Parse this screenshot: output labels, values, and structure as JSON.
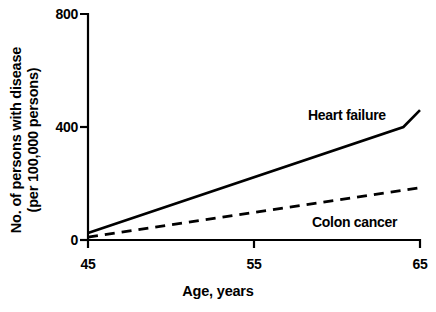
{
  "chart_data": {
    "type": "line",
    "title": "",
    "xlabel": "Age, years",
    "ylabel_line1": "No. of persons with disease",
    "ylabel_line2": "(per 100,000 persons)",
    "xlim": [
      45,
      65
    ],
    "ylim": [
      0,
      800
    ],
    "xticks": [
      45,
      55,
      65
    ],
    "xtick_labels": [
      "45",
      "55",
      "65"
    ],
    "yticks": [
      0,
      400,
      800
    ],
    "ytick_labels": [
      "0",
      "400",
      "800"
    ],
    "grid": false,
    "legend_position": "inline-annotation",
    "series": [
      {
        "name": "Heart failure",
        "style": "solid",
        "color": "#000000",
        "x": [
          45,
          64,
          65
        ],
        "values": [
          25,
          400,
          460
        ]
      },
      {
        "name": "Colon cancer",
        "style": "dashed",
        "color": "#000000",
        "x": [
          45,
          65
        ],
        "values": [
          10,
          185
        ]
      }
    ],
    "annotations": [
      {
        "text": "Heart failure",
        "x": 59.2,
        "y": 455
      },
      {
        "text": "Colon cancer",
        "x": 58.6,
        "y": 110
      }
    ]
  },
  "axis": {
    "ytick_800": "800",
    "ytick_400": "400",
    "ytick_0": "0",
    "xtick_45": "45",
    "xtick_55": "55",
    "xtick_65": "65",
    "x_title": "Age, years",
    "y_title_top": "No. of persons with disease",
    "y_title_bottom": "(per 100,000 persons)"
  },
  "labels": {
    "heart_failure": "Heart failure",
    "colon_cancer": "Colon cancer"
  }
}
